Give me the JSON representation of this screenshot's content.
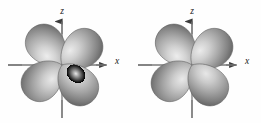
{
  "figure": {
    "caption": "",
    "background_color": "#fefefe",
    "axis_color": "#6e6e6e",
    "axis_label_color": "#1a1a1a",
    "lobe_highlight_color": "#e2e2e2",
    "lobe_mid_color": "#b4b4b4",
    "lobe_shadow_color": "#6f6f6f",
    "lobe_outline_color": "#5a5a5a"
  },
  "panels": [
    {
      "id": "left-orbital",
      "name": "d-orbital-diagram-left",
      "orbital_type": "d",
      "lobe_count": 4,
      "origin": {
        "x": 62,
        "y": 65
      },
      "axes": [
        {
          "name": "z",
          "label": "z",
          "orientation": "vertical",
          "arrow": "up",
          "from": {
            "x": 62,
            "y": 118
          },
          "to": {
            "x": 62,
            "y": 20
          },
          "label_pos": {
            "x": 62,
            "y": 11
          }
        },
        {
          "name": "x",
          "label": "x",
          "orientation": "horizontal",
          "arrow": "right",
          "from": {
            "x": 8,
            "y": 65
          },
          "to": {
            "x": 108,
            "y": 65
          },
          "label_pos": {
            "x": 117,
            "y": 64
          }
        }
      ],
      "lobes": [
        {
          "name": "lobe-upper-left",
          "angle_deg": 135
        },
        {
          "name": "lobe-upper-right",
          "angle_deg": 45
        },
        {
          "name": "lobe-lower-left",
          "angle_deg": 225
        },
        {
          "name": "lobe-lower-right",
          "angle_deg": 315
        }
      ]
    },
    {
      "id": "right-orbital",
      "name": "d-orbital-diagram-right",
      "orbital_type": "d",
      "lobe_count": 4,
      "origin": {
        "x": 62,
        "y": 65
      },
      "axes": [
        {
          "name": "z",
          "label": "z",
          "orientation": "vertical",
          "arrow": "up",
          "from": {
            "x": 62,
            "y": 118
          },
          "to": {
            "x": 62,
            "y": 20
          },
          "label_pos": {
            "x": 62,
            "y": 11
          }
        },
        {
          "name": "x",
          "label": "x",
          "orientation": "horizontal",
          "arrow": "right",
          "from": {
            "x": 8,
            "y": 65
          },
          "to": {
            "x": 108,
            "y": 65
          },
          "label_pos": {
            "x": 117,
            "y": 64
          }
        }
      ],
      "lobes": [
        {
          "name": "lobe-upper-left",
          "angle_deg": 135
        },
        {
          "name": "lobe-upper-right",
          "angle_deg": 45
        },
        {
          "name": "lobe-lower-left",
          "angle_deg": 225
        },
        {
          "name": "lobe-lower-right",
          "angle_deg": 315
        }
      ]
    }
  ]
}
